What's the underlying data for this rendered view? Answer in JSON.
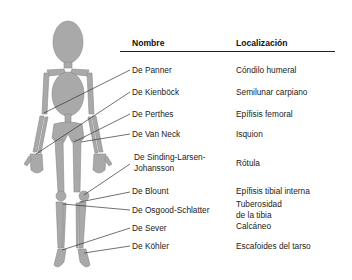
{
  "table": {
    "headers": {
      "name": "Nombre",
      "location": "Localización"
    },
    "rows": [
      {
        "name": "De Panner",
        "location": "Cóndilo humeral"
      },
      {
        "name": "De Kienböck",
        "location": "Semilunar carpiano"
      },
      {
        "name": "De Perthes",
        "location": "Epífisis femoral"
      },
      {
        "name": "De Van Neck",
        "location": "Isquion"
      },
      {
        "name_line1": "De Sinding-Larsen-",
        "name_line2": "Johansson",
        "location": "Rótula"
      },
      {
        "name": "De Blount",
        "location": "Epífisis tibial interna"
      },
      {
        "name": "De Osgood-Schlatter",
        "location_line1": "Tuberosidad",
        "location_line2": "de la tibia"
      },
      {
        "name": "De Sever",
        "location": "Calcáneo"
      },
      {
        "name": "De Köhler",
        "location": "Escafoides del tarso"
      }
    ]
  },
  "figure": {
    "bone_fill": "#a9a9a9",
    "bone_stroke": "#7a7a7a",
    "leader_color": "#333333"
  }
}
